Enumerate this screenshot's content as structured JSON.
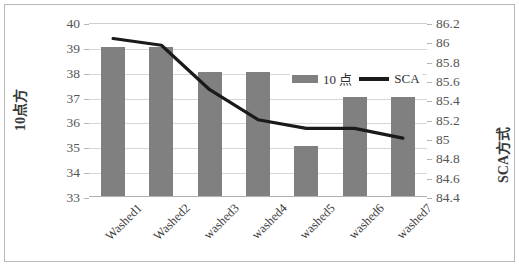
{
  "chart_data": {
    "type": "bar",
    "title": "",
    "categories": [
      "Washed1",
      "Washed2",
      "washed3",
      "washed4",
      "washed5",
      "washed6",
      "washed7"
    ],
    "series": [
      {
        "name": "10 点",
        "type": "bar",
        "axis": "left",
        "color": "#808080",
        "values": [
          39,
          39,
          38,
          38,
          35,
          37,
          37
        ]
      },
      {
        "name": "SCA",
        "type": "line",
        "axis": "right",
        "color": "#1a1a1a",
        "values": [
          86.05,
          85.98,
          85.52,
          85.21,
          85.12,
          85.12,
          85.02
        ]
      }
    ],
    "xlabel": "",
    "ylabel": "10点方",
    "y2label": "SCA方式",
    "ylim": [
      33,
      40
    ],
    "yticks": [
      33,
      34,
      35,
      36,
      37,
      38,
      39,
      40
    ],
    "ytick_labels": [
      "33",
      "34",
      "35",
      "36",
      "37",
      "38",
      "39",
      "40"
    ],
    "y2lim": [
      84.4,
      86.2
    ],
    "y2ticks": [
      84.4,
      84.6,
      84.8,
      85,
      85.2,
      85.4,
      85.6,
      85.8,
      86,
      86.2
    ],
    "y2tick_labels": [
      "84.4",
      "84.6",
      "84.8",
      "85",
      "85.2",
      "85.4",
      "85.6",
      "85.8",
      "86",
      "86.2"
    ],
    "grid": true,
    "legend_position": "inside-top-right"
  },
  "legend": {
    "bar_label": "10 点",
    "line_label": "SCA"
  },
  "axes": {
    "left_title": "10点方",
    "right_title": "SCA方式"
  }
}
